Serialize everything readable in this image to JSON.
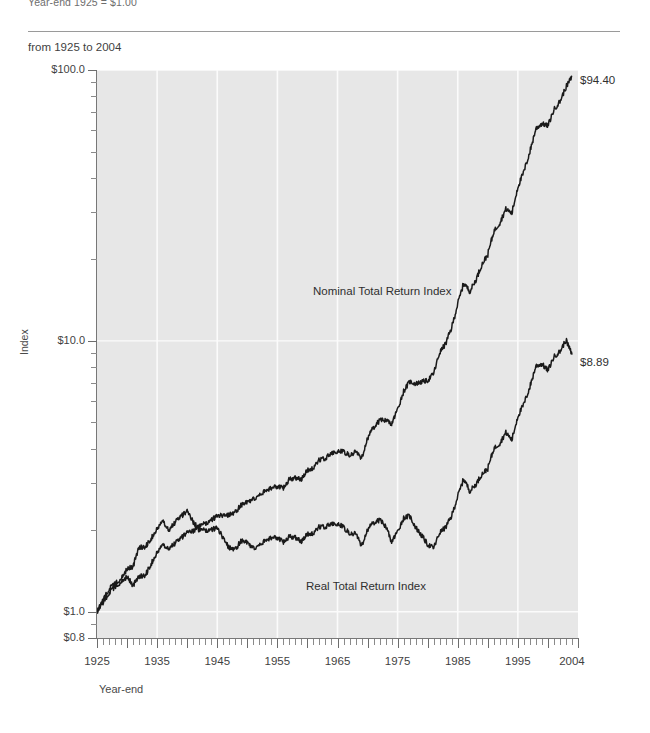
{
  "header": {
    "top_note": "Year-end 1925 = $1.00",
    "subtitle": "from 1925 to 2004"
  },
  "chart_data": {
    "type": "line",
    "title": "",
    "subtitle": "from 1925 to 2004",
    "xlabel": "Year-end",
    "ylabel": "Index",
    "yscale": "log",
    "ylim": [
      0.8,
      100.0
    ],
    "xlim": [
      1925,
      2005
    ],
    "grid": "vertical-white-decade-gridlines",
    "legend": "inline-series-labels",
    "ytick_labels": [
      "$100.0",
      "$10.0",
      "$1.0",
      "$0.8"
    ],
    "ytick_values": [
      100.0,
      10.0,
      1.0,
      0.8
    ],
    "xtick_labels": [
      "1925",
      "1935",
      "1945",
      "1955",
      "1965",
      "1975",
      "1985",
      "1995",
      "2004"
    ],
    "xtick_values": [
      1925,
      1935,
      1945,
      1955,
      1965,
      1975,
      1985,
      1995,
      2004
    ],
    "annotations": [
      {
        "text": "$94.40",
        "series": "Nominal Total Return Index",
        "x": 2004,
        "y": 94.4
      },
      {
        "text": "$8.89",
        "series": "Real Total Return Index",
        "x": 2004,
        "y": 8.89
      }
    ],
    "series": [
      {
        "name": "Nominal Total Return Index",
        "color": "#1a1a1a",
        "final_value": 94.4,
        "x": [
          1925,
          1926,
          1927,
          1928,
          1929,
          1930,
          1931,
          1932,
          1933,
          1934,
          1935,
          1936,
          1937,
          1938,
          1939,
          1940,
          1941,
          1942,
          1943,
          1944,
          1945,
          1946,
          1947,
          1948,
          1949,
          1950,
          1951,
          1952,
          1953,
          1954,
          1955,
          1956,
          1957,
          1958,
          1959,
          1960,
          1961,
          1962,
          1963,
          1964,
          1965,
          1966,
          1967,
          1968,
          1969,
          1970,
          1971,
          1972,
          1973,
          1974,
          1975,
          1976,
          1977,
          1978,
          1979,
          1980,
          1981,
          1982,
          1983,
          1984,
          1985,
          1986,
          1987,
          1988,
          1989,
          1990,
          1991,
          1992,
          1993,
          1994,
          1995,
          1996,
          1997,
          1998,
          1999,
          2000,
          2001,
          2002,
          2003,
          2004
        ],
        "values": [
          1.0,
          1.08,
          1.17,
          1.24,
          1.29,
          1.35,
          1.25,
          1.35,
          1.36,
          1.5,
          1.65,
          1.76,
          1.72,
          1.79,
          1.87,
          1.97,
          1.99,
          2.06,
          2.12,
          2.18,
          2.26,
          2.27,
          2.28,
          2.33,
          2.48,
          2.54,
          2.6,
          2.69,
          2.79,
          2.87,
          2.89,
          2.87,
          3.09,
          3.12,
          3.09,
          3.32,
          3.4,
          3.64,
          3.69,
          3.84,
          3.91,
          3.9,
          3.79,
          3.89,
          3.68,
          4.37,
          4.79,
          5.08,
          5.1,
          4.93,
          5.6,
          6.52,
          7.07,
          6.95,
          7.06,
          7.14,
          7.58,
          9.06,
          9.77,
          11.21,
          13.71,
          16.36,
          15.24,
          16.76,
          19.11,
          20.87,
          25.36,
          27.29,
          30.69,
          29.59,
          37.1,
          42.08,
          49.95,
          60.81,
          63.4,
          62.18,
          71.39,
          76.64,
          86.47,
          94.4
        ]
      },
      {
        "name": "Real Total Return Index",
        "color": "#1a1a1a",
        "final_value": 8.89,
        "x": [
          1925,
          1926,
          1927,
          1928,
          1929,
          1930,
          1931,
          1932,
          1933,
          1934,
          1935,
          1936,
          1937,
          1938,
          1939,
          1940,
          1941,
          1942,
          1943,
          1944,
          1945,
          1946,
          1947,
          1948,
          1949,
          1950,
          1951,
          1952,
          1953,
          1954,
          1955,
          1956,
          1957,
          1958,
          1959,
          1960,
          1961,
          1962,
          1963,
          1964,
          1965,
          1966,
          1967,
          1968,
          1969,
          1970,
          1971,
          1972,
          1973,
          1974,
          1975,
          1976,
          1977,
          1978,
          1979,
          1980,
          1981,
          1982,
          1983,
          1984,
          1985,
          1986,
          1987,
          1988,
          1989,
          1990,
          1991,
          1992,
          1993,
          1994,
          1995,
          1996,
          1997,
          1998,
          1999,
          2000,
          2001,
          2002,
          2003,
          2004
        ],
        "values": [
          1.0,
          1.1,
          1.21,
          1.27,
          1.33,
          1.44,
          1.47,
          1.73,
          1.73,
          1.86,
          2.02,
          2.15,
          2.01,
          2.14,
          2.25,
          2.36,
          2.15,
          2.0,
          2.0,
          2.01,
          2.04,
          1.87,
          1.72,
          1.7,
          1.83,
          1.8,
          1.71,
          1.76,
          1.83,
          1.88,
          1.87,
          1.81,
          1.9,
          1.88,
          1.82,
          1.93,
          1.95,
          2.06,
          2.06,
          2.11,
          2.11,
          2.05,
          1.95,
          1.94,
          1.75,
          2.01,
          2.13,
          2.18,
          2.07,
          1.81,
          1.98,
          2.22,
          2.26,
          2.05,
          1.91,
          1.77,
          1.72,
          1.96,
          2.05,
          2.26,
          2.67,
          3.1,
          2.79,
          2.95,
          3.22,
          3.38,
          4.0,
          4.19,
          4.59,
          4.31,
          5.28,
          5.84,
          6.76,
          8.09,
          8.21,
          7.77,
          8.74,
          9.14,
          10.07,
          8.89
        ]
      }
    ]
  }
}
